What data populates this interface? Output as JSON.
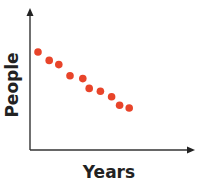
{
  "chart_data": {
    "type": "scatter",
    "title": "",
    "xlabel": "Years",
    "ylabel": "People",
    "grid": false,
    "legend": null,
    "xticks": [],
    "yticks": [],
    "xlim": [
      0,
      10
    ],
    "ylim": [
      0,
      10
    ],
    "points": [
      {
        "x": 0.5,
        "y": 7.0
      },
      {
        "x": 1.2,
        "y": 6.4
      },
      {
        "x": 1.8,
        "y": 6.1
      },
      {
        "x": 2.5,
        "y": 5.3
      },
      {
        "x": 3.3,
        "y": 5.1
      },
      {
        "x": 3.7,
        "y": 4.4
      },
      {
        "x": 4.4,
        "y": 4.2
      },
      {
        "x": 5.1,
        "y": 3.8
      },
      {
        "x": 5.6,
        "y": 3.2
      },
      {
        "x": 6.2,
        "y": 3.0
      }
    ],
    "series_color": "#E8442A",
    "trend": "negative"
  }
}
